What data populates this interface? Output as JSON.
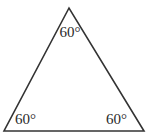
{
  "diagram": {
    "type": "equilateral-triangle",
    "stroke_color": "#333333",
    "background": "#ffffff",
    "angles": {
      "top": "60°",
      "bottom_left": "60°",
      "bottom_right": "60°"
    }
  }
}
